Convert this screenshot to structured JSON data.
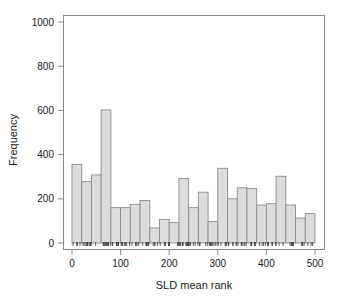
{
  "chart_data": {
    "type": "bar",
    "title": "",
    "subtitle": "",
    "xlabel": "SLD mean rank",
    "ylabel": "Frequency",
    "xlim": [
      0,
      500
    ],
    "ylim": [
      0,
      1050
    ],
    "xticks": [
      0,
      100,
      200,
      300,
      400,
      500
    ],
    "yticks": [
      0,
      200,
      400,
      600,
      800,
      1000
    ],
    "xtick_labels": [
      "0",
      "100",
      "200",
      "300",
      "400",
      "500"
    ],
    "ytick_labels": [
      "0",
      "200",
      "400",
      "600",
      "800",
      "1000"
    ],
    "grid": false,
    "legend": null,
    "bin_width": 20,
    "bin_edges": [
      0,
      20,
      40,
      60,
      80,
      100,
      120,
      140,
      160,
      180,
      200,
      220,
      240,
      260,
      280,
      300,
      320,
      340,
      360,
      380,
      400,
      420,
      440,
      460,
      480,
      500
    ],
    "categories": [
      "0-20",
      "20-40",
      "40-60",
      "60-80",
      "80-100",
      "100-120",
      "120-140",
      "140-160",
      "160-180",
      "180-200",
      "200-220",
      "220-240",
      "240-260",
      "260-280",
      "280-300",
      "300-320",
      "320-340",
      "340-360",
      "360-380",
      "380-400",
      "400-420",
      "420-440",
      "440-460",
      "460-480",
      "480-500"
    ],
    "values": [
      355,
      278,
      308,
      602,
      160,
      160,
      175,
      192,
      68,
      107,
      92,
      292,
      160,
      230,
      97,
      338,
      200,
      250,
      247,
      172,
      178,
      302,
      172,
      113,
      133
    ],
    "bar_fill_color": "#dcdcdc",
    "bar_edge_color": "#8c8c8c",
    "axis_color": "#8a8a8a",
    "text_color": "#1a1a1a",
    "rug_shown": true
  },
  "plot": {
    "frame_left": 63,
    "frame_right": 325,
    "frame_top": 15,
    "frame_bottom": 250
  }
}
